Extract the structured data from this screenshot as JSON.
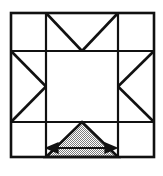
{
  "figure": {
    "title": "Nine-patch block with shaded measured triangle",
    "canvas": {
      "width": 163,
      "height": 176
    },
    "colors": {
      "stroke": "#111111",
      "background": "#ffffff",
      "fill_shaded": "#b3b3b3",
      "fill_empty": "#ffffff",
      "arrow": "#111111"
    },
    "line_weights": {
      "outer_border": 2.6,
      "grid": 2.2,
      "diagonal": 2.6,
      "arrow": 2.0
    }
  },
  "grid": {
    "label": "3x3 block grid",
    "outer": {
      "x": 11,
      "y": 13,
      "width": 143,
      "height": 144
    },
    "columns_x": [
      11,
      46,
      118,
      154
    ],
    "rows_y": [
      13,
      51,
      122,
      157
    ],
    "column_count": 3,
    "row_count": 3
  },
  "cells": [
    {
      "name": "top-left",
      "row": 0,
      "col": 0,
      "motif": "empty",
      "shaded": false
    },
    {
      "name": "top-center",
      "row": 0,
      "col": 1,
      "motif": "vee-down",
      "shaded": false
    },
    {
      "name": "top-right",
      "row": 0,
      "col": 2,
      "motif": "empty",
      "shaded": false
    },
    {
      "name": "middle-left",
      "row": 1,
      "col": 0,
      "motif": "triangle-right",
      "shaded": false
    },
    {
      "name": "center",
      "row": 1,
      "col": 1,
      "motif": "empty",
      "shaded": false
    },
    {
      "name": "middle-right",
      "row": 1,
      "col": 2,
      "motif": "triangle-left",
      "shaded": false
    },
    {
      "name": "bottom-left",
      "row": 2,
      "col": 0,
      "motif": "empty",
      "shaded": false
    },
    {
      "name": "bottom-center",
      "row": 2,
      "col": 1,
      "motif": "triangle-up-shaded",
      "shaded": true
    },
    {
      "name": "bottom-right",
      "row": 2,
      "col": 2,
      "motif": "empty",
      "shaded": false
    }
  ],
  "shaded_triangle": {
    "name": "bottom-center-shaded-triangle",
    "apex": {
      "x": 82,
      "y": 122
    },
    "base_left": {
      "x": 46,
      "y": 157
    },
    "base_right": {
      "x": 118,
      "y": 157
    },
    "fill_pattern": "stipple-gray"
  },
  "dimension_arrow": {
    "name": "base-width-arrow",
    "orientation": "horizontal",
    "double_headed": true,
    "x_start": 57,
    "x_end": 106,
    "y": 148,
    "label": ""
  },
  "motif_paths": {
    "vee_down": "two diagonals from upper corners meeting at bottom-center",
    "triangle_right": "two diagonals from left corners meeting at right-center",
    "triangle_left": "two diagonals from right corners meeting at left-center"
  }
}
